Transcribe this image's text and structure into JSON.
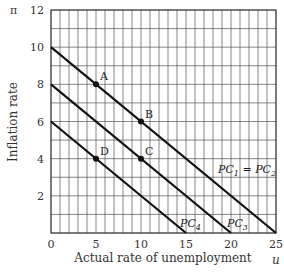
{
  "chart_data": {
    "type": "line",
    "title": "",
    "xlabel": "Actual rate of unemployment",
    "ylabel": "Inflation rate",
    "x_symbol": "u",
    "y_symbol": "π",
    "xlim": [
      0,
      25
    ],
    "ylim": [
      0,
      12
    ],
    "x_ticks": [
      0,
      5,
      10,
      15,
      20,
      25
    ],
    "y_ticks": [
      2,
      4,
      6,
      8,
      10,
      12
    ],
    "grid": true,
    "grid_step_x": 1,
    "grid_step_y": 1,
    "series": [
      {
        "name": "PC1 = PC2",
        "label_main": "PC",
        "label_sub1": "1",
        "label_eq": " = PC",
        "label_sub2": "2",
        "x": [
          0,
          25
        ],
        "y": [
          10,
          0
        ]
      },
      {
        "name": "PC3",
        "label_main": "PC",
        "label_sub1": "3",
        "x": [
          0,
          20
        ],
        "y": [
          8,
          0
        ]
      },
      {
        "name": "PC4",
        "label_main": "PC",
        "label_sub1": "4",
        "x": [
          0,
          15
        ],
        "y": [
          6,
          0
        ]
      }
    ],
    "points": [
      {
        "label": "A",
        "x": 5,
        "y": 8
      },
      {
        "label": "B",
        "x": 10,
        "y": 6
      },
      {
        "label": "C",
        "x": 10,
        "y": 4
      },
      {
        "label": "D",
        "x": 5,
        "y": 4
      }
    ],
    "colors": {
      "grid": "#555555",
      "line": "#111111",
      "text": "#333333"
    }
  }
}
